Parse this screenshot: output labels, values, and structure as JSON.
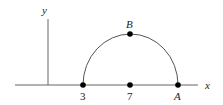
{
  "diagram": {
    "type": "coordinate-geometry",
    "axes": {
      "x_label": "x",
      "y_label": "y"
    },
    "points": [
      {
        "id": "left-endpoint",
        "label": "3",
        "x_value": 3,
        "on": "x-axis"
      },
      {
        "id": "center",
        "label": "7",
        "x_value": 7,
        "on": "x-axis"
      },
      {
        "id": "A",
        "label": "A",
        "on": "x-axis"
      },
      {
        "id": "B",
        "label": "B",
        "on": "semicircle-top"
      }
    ],
    "curve": {
      "shape": "semicircle",
      "center_label": "7"
    },
    "colors": {
      "axis": "#666666",
      "curve": "#555555",
      "point": "#000000",
      "text": "#222222"
    }
  }
}
